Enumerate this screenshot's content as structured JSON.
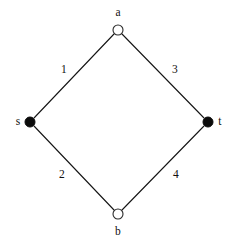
{
  "figure": {
    "type": "graph-diagram",
    "shape": "diamond",
    "background_color": "#ffffff",
    "line_color": "#151515"
  },
  "nodes": [
    {
      "id": "a",
      "label": "a",
      "style": "hollow",
      "fill_color": "#ffffff",
      "stroke_color": "#2b2b2b",
      "cx": 118,
      "cy": 30,
      "r": 5,
      "label_x": 118,
      "label_y": 13
    },
    {
      "id": "s",
      "label": "s",
      "style": "filled",
      "fill_color": "#0b0b0b",
      "stroke_color": "#0b0b0b",
      "cx": 30,
      "cy": 122,
      "r": 5,
      "label_x": 18,
      "label_y": 122
    },
    {
      "id": "t",
      "label": "t",
      "style": "filled",
      "fill_color": "#0b0b0b",
      "stroke_color": "#0b0b0b",
      "cx": 208,
      "cy": 122,
      "r": 5,
      "label_x": 220,
      "label_y": 122
    },
    {
      "id": "b",
      "label": "b",
      "style": "hollow",
      "fill_color": "#ffffff",
      "stroke_color": "#2b2b2b",
      "cx": 118,
      "cy": 214,
      "r": 5,
      "label_x": 118,
      "label_y": 232
    }
  ],
  "edges": [
    {
      "id": "s-a",
      "from": "s",
      "to": "a",
      "label": "1",
      "x1": 34,
      "y1": 118,
      "x2": 114,
      "y2": 34,
      "label_x": 64,
      "label_y": 70
    },
    {
      "id": "a-t",
      "from": "a",
      "to": "t",
      "label": "3",
      "x1": 122,
      "y1": 34,
      "x2": 204,
      "y2": 118,
      "label_x": 175,
      "label_y": 70
    },
    {
      "id": "s-b",
      "from": "s",
      "to": "b",
      "label": "2",
      "x1": 34,
      "y1": 126,
      "x2": 114,
      "y2": 210,
      "label_x": 62,
      "label_y": 175
    },
    {
      "id": "b-t",
      "from": "b",
      "to": "t",
      "label": "4",
      "x1": 122,
      "y1": 210,
      "x2": 204,
      "y2": 126,
      "label_x": 176,
      "label_y": 175
    }
  ]
}
